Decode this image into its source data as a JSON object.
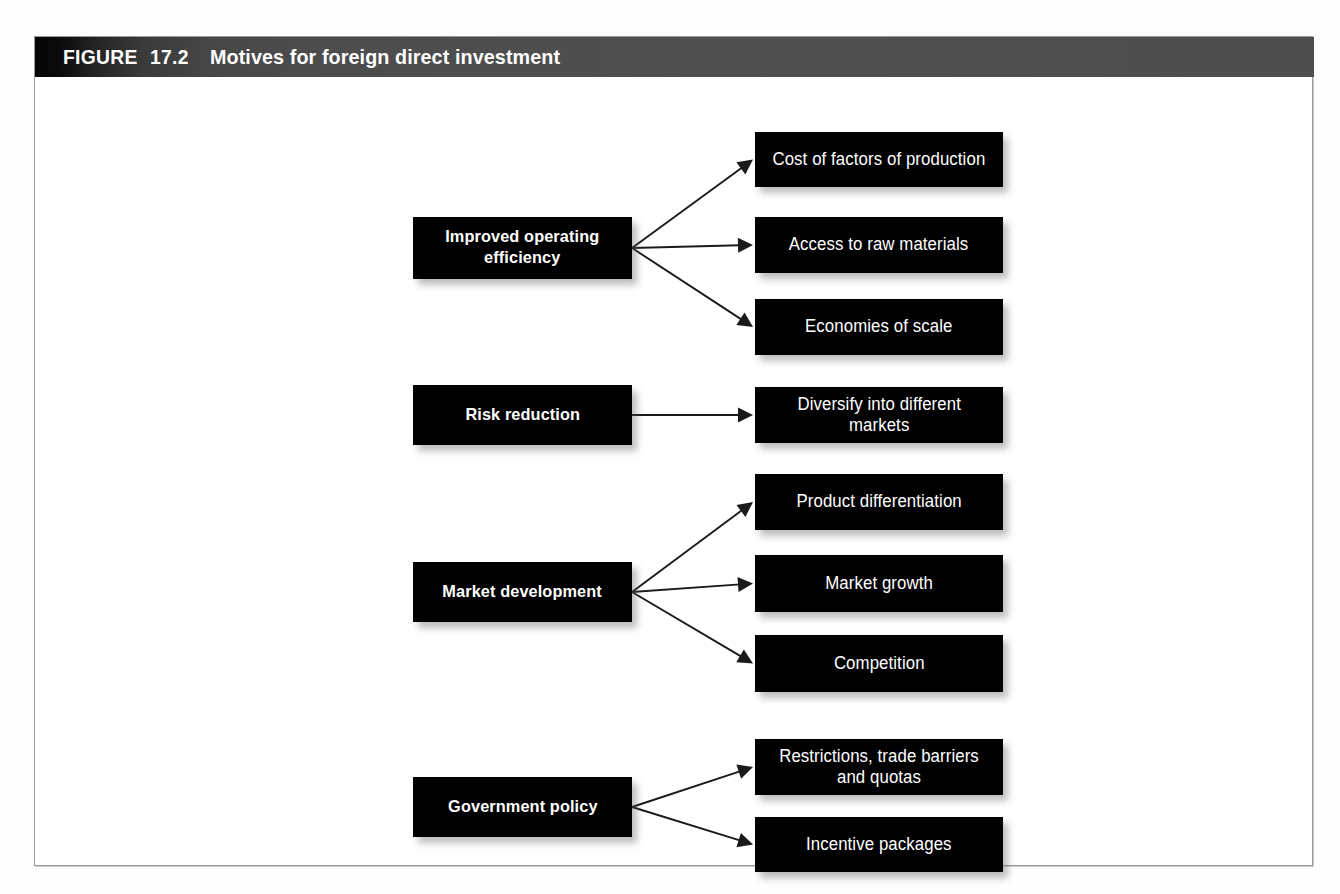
{
  "figure": {
    "label": "FIGURE",
    "number": "17.2",
    "title": "Motives for foreign direct investment"
  },
  "colors": {
    "box_fill": "#000000",
    "box_text": "#ffffff",
    "header_dark": "#050505",
    "header_gray": "#4f4f4f",
    "frame_border": "#9a9a9a",
    "arrow": "#1a1a1a",
    "page_background": "#ffffff"
  },
  "diagram": {
    "type": "tree",
    "groups": [
      {
        "id": "improved-operating-efficiency",
        "source": {
          "label": "Improved operating efficiency",
          "lines": [
            "Improved operating",
            "efficiency"
          ],
          "x": 378,
          "y": 180,
          "w": 219,
          "h": 62
        },
        "targets": [
          {
            "id": "cost-of-factors-of-production",
            "label": "Cost of factors of production",
            "lines": [
              "Cost of factors of production"
            ],
            "x": 720,
            "y": 95,
            "w": 248,
            "h": 55
          },
          {
            "id": "access-to-raw-materials",
            "label": "Access to raw materials",
            "lines": [
              "Access to raw materials"
            ],
            "x": 720,
            "y": 180,
            "w": 248,
            "h": 56
          },
          {
            "id": "economies-of-scale",
            "label": "Economies of scale",
            "lines": [
              "Economies of scale"
            ],
            "x": 720,
            "y": 262,
            "w": 248,
            "h": 56
          }
        ]
      },
      {
        "id": "risk-reduction",
        "source": {
          "label": "Risk reduction",
          "lines": [
            "Risk reduction"
          ],
          "x": 378,
          "y": 348,
          "w": 219,
          "h": 60
        },
        "targets": [
          {
            "id": "diversify-into-different-markets",
            "label": "Diversify into different markets",
            "lines": [
              "Diversify into different",
              "markets"
            ],
            "x": 720,
            "y": 350,
            "w": 248,
            "h": 56
          }
        ]
      },
      {
        "id": "market-development",
        "source": {
          "label": "Market development",
          "lines": [
            "Market development"
          ],
          "x": 378,
          "y": 525,
          "w": 219,
          "h": 60
        },
        "targets": [
          {
            "id": "product-differentiation",
            "label": "Product differentiation",
            "lines": [
              "Product differentiation"
            ],
            "x": 720,
            "y": 437,
            "w": 248,
            "h": 56
          },
          {
            "id": "market-growth",
            "label": "Market growth",
            "lines": [
              "Market growth"
            ],
            "x": 720,
            "y": 518,
            "w": 248,
            "h": 57
          },
          {
            "id": "competition",
            "label": "Competition",
            "lines": [
              "Competition"
            ],
            "x": 720,
            "y": 598,
            "w": 248,
            "h": 57
          }
        ]
      },
      {
        "id": "government-policy",
        "source": {
          "label": "Government policy",
          "lines": [
            "Government policy"
          ],
          "x": 378,
          "y": 740,
          "w": 219,
          "h": 60
        },
        "targets": [
          {
            "id": "restrictions-trade-barriers-and-quotas",
            "label": "Restrictions, trade barriers and quotas",
            "lines": [
              "Restrictions, trade barriers",
              "and quotas"
            ],
            "x": 720,
            "y": 702,
            "w": 248,
            "h": 56
          },
          {
            "id": "incentive-packages",
            "label": "Incentive packages",
            "lines": [
              "Incentive packages"
            ],
            "x": 720,
            "y": 780,
            "w": 248,
            "h": 55
          }
        ]
      }
    ]
  }
}
